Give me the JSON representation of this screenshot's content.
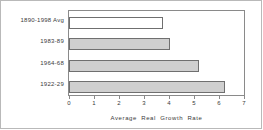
{
  "chart_data": {
    "type": "bar",
    "orientation": "horizontal",
    "title": "",
    "subtitle": "",
    "xlabel": "Average  Real  Growth  Rate",
    "ylabel": "",
    "xlim": [
      0,
      7
    ],
    "xticks": [
      "0",
      "1",
      "2",
      "3",
      "4",
      "5",
      "6",
      "7"
    ],
    "grid": false,
    "legend": null,
    "categories": [
      "1890-1998  Avg",
      "1983-89",
      "1964-68",
      "1922-29"
    ],
    "values": [
      3.75,
      4.05,
      5.2,
      6.25
    ],
    "series": [
      {
        "name": "Average Real Growth Rate",
        "values": [
          3.75,
          4.05,
          5.2,
          6.25
        ]
      }
    ],
    "bars": [
      {
        "label": "1890-1998  Avg",
        "value": 3.75,
        "style": "hollow"
      },
      {
        "label": "1983-89",
        "value": 4.05,
        "style": "filled"
      },
      {
        "label": "1964-68",
        "value": 5.2,
        "style": "filled"
      },
      {
        "label": "1922-29",
        "value": 6.25,
        "style": "filled"
      }
    ],
    "colors": {
      "bar_fill": "#cfcfcf",
      "bar_hollow_fill": "#ffffff",
      "bar_edge": "#6f6f6f",
      "axis": "#8a8a8a",
      "frame": "#b9b9b9",
      "text": "#3a3a3a",
      "background": "#ffffff"
    }
  }
}
